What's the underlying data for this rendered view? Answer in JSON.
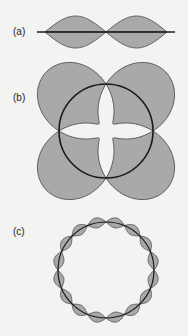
{
  "figure": {
    "panels": [
      {
        "label": "(a)",
        "description": "standing wave with two loops on a string",
        "loops": 2
      },
      {
        "label": "(b)",
        "description": "standing wave on a circular path with 4 loops",
        "loops": 4
      },
      {
        "label": "(c)",
        "description": "standing wave on a circular path with 16 loops",
        "loops": 16
      }
    ],
    "colors": {
      "fill": "#a9a9a9",
      "line": "#1a1a1a",
      "background": "#f3f3f1"
    }
  }
}
